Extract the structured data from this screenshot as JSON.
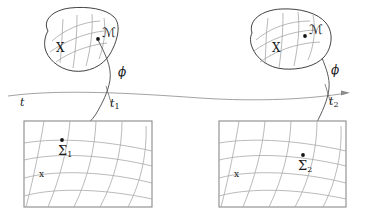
{
  "figure": {
    "type": "diagram",
    "background_color": "#ffffff",
    "ink_color": "#2b2b2b",
    "grid_color": "#9a9a9a",
    "box_border_color": "#8a8a8a"
  },
  "manifolds": [
    {
      "id": "manifold-left",
      "manifold_label": "ℳ",
      "space_label": "X",
      "point_marker": "filled-dot",
      "map_label": "ϕ",
      "time_label": "t",
      "time_sub": "1"
    },
    {
      "id": "manifold-right",
      "manifold_label": "ℳ",
      "space_label": "X",
      "point_marker": "filled-dot",
      "map_label": "ϕ",
      "time_label": "t",
      "time_sub": "2"
    }
  ],
  "axis": {
    "name": "time-axis",
    "label": "t",
    "arrow": "right",
    "ticks": [
      {
        "label": "t",
        "sub": "1"
      },
      {
        "label": "t",
        "sub": "2"
      }
    ]
  },
  "panels": [
    {
      "id": "panel-left",
      "point_label": "Ʃ",
      "point_sub": "1",
      "space_label": "x",
      "grid": "curvilinear"
    },
    {
      "id": "panel-right",
      "point_label": "Ʃ",
      "point_sub": "2",
      "space_label": "x",
      "grid": "curvilinear"
    }
  ]
}
